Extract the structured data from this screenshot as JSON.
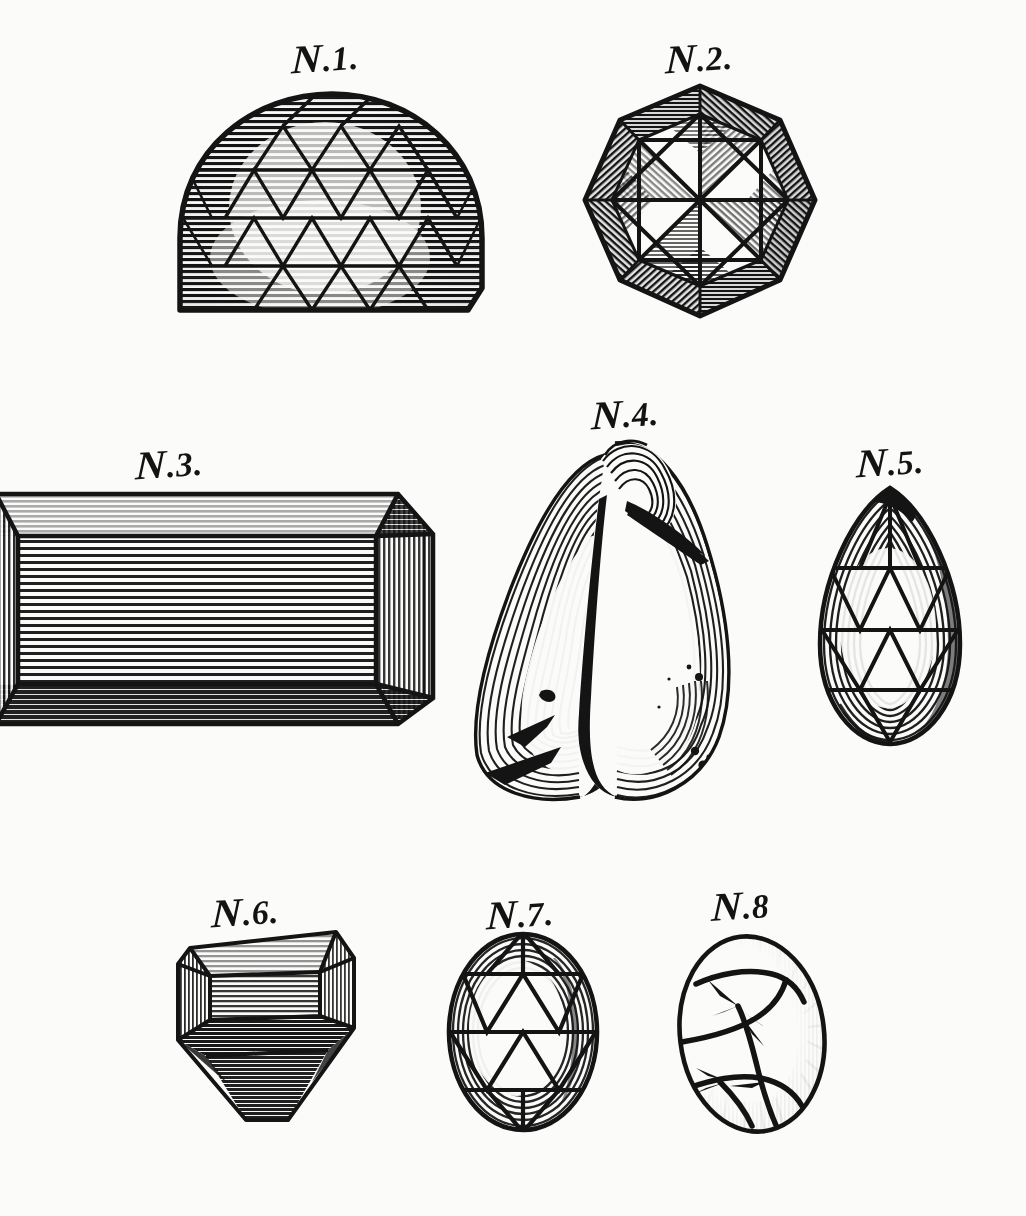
{
  "plate": {
    "kind": "engraved-plate",
    "medium": "line engraving",
    "background_color": "#fbfbfa",
    "ink_color": "#141414",
    "width": 1026,
    "height": 1216
  },
  "figures": [
    {
      "id": "n1",
      "label": "N.1.",
      "label_prefix": "N",
      "label_suffix": ".1.",
      "subject": "dome-cut cabochon gem with triangular facet lattice",
      "shape": "dome",
      "label_x": 292,
      "label_y": 38,
      "label_size": 34
    },
    {
      "id": "n2",
      "label": "N.2.",
      "label_prefix": "N",
      "label_suffix": ".2.",
      "subject": "octagonal brilliant-cut faceted gem with star facets",
      "shape": "octagon",
      "label_x": 666,
      "label_y": 38,
      "label_size": 34
    },
    {
      "id": "n3",
      "label": "N.3.",
      "label_prefix": "N",
      "label_suffix": ".3.",
      "subject": "rectangular table-cut gem with bevelled border, cropped at left edge",
      "shape": "rectangle",
      "label_x": 136,
      "label_y": 444,
      "label_size": 34
    },
    {
      "id": "n4",
      "label": "N.4.",
      "label_prefix": "N",
      "label_suffix": ".4.",
      "subject": "baroque irregular pearl with contour hatching, fissures and pits",
      "shape": "baroque",
      "label_x": 592,
      "label_y": 394,
      "label_size": 34
    },
    {
      "id": "n5",
      "label": "N.5.",
      "label_prefix": "N",
      "label_suffix": ".5.",
      "subject": "pear drop-shaped faceted gem with triangular lattice",
      "shape": "pear",
      "label_x": 857,
      "label_y": 442,
      "label_size": 34
    },
    {
      "id": "n6",
      "label": "N.6.",
      "label_prefix": "N",
      "label_suffix": ".6.",
      "subject": "angled table-cut gem with tapered pavilion",
      "shape": "table-cut",
      "label_x": 212,
      "label_y": 892,
      "label_size": 34
    },
    {
      "id": "n7",
      "label": "N.7.",
      "label_prefix": "N",
      "label_suffix": ".7.",
      "subject": "oval faceted gem with triangular lattice",
      "shape": "oval",
      "label_x": 487,
      "label_y": 894,
      "label_size": 34
    },
    {
      "id": "n8",
      "label": "N.8",
      "label_prefix": "N",
      "label_suffix": ".8",
      "subject": "oval gem with irregular cracks and flaws",
      "shape": "oval",
      "label_x": 712,
      "label_y": 886,
      "label_size": 34
    }
  ]
}
